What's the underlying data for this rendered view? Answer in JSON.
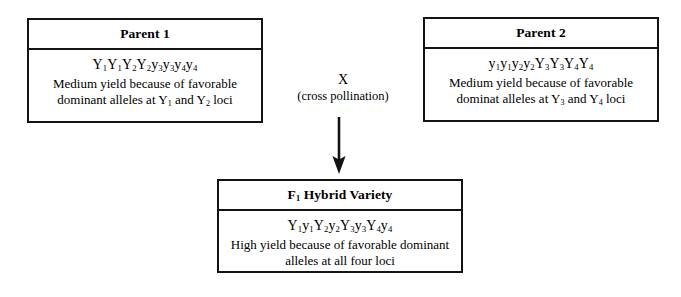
{
  "diagram": {
    "parent1": {
      "header": "Parent 1",
      "genotype_parts": [
        {
          "base": "Y",
          "sub": "1"
        },
        {
          "base": "Y",
          "sub": "1"
        },
        {
          "base": "Y",
          "sub": "2"
        },
        {
          "base": "Y",
          "sub": "2"
        },
        {
          "base": "y",
          "sub": "3"
        },
        {
          "base": "y",
          "sub": "3"
        },
        {
          "base": "y",
          "sub": "4"
        },
        {
          "base": "y",
          "sub": "4"
        }
      ],
      "genotype_text": "Y1Y1Y2Y2y3y3y4y4",
      "description_line1": "Medium yield because of favorable",
      "description_prefix": "dominant alleles at Y",
      "locus1": "1",
      "description_middle": " and Y",
      "locus2": "2",
      "description_suffix": " loci"
    },
    "parent2": {
      "header": "Parent 2",
      "genotype_parts": [
        {
          "base": "y",
          "sub": "1"
        },
        {
          "base": "y",
          "sub": "1"
        },
        {
          "base": "y",
          "sub": "2"
        },
        {
          "base": "y",
          "sub": "2"
        },
        {
          "base": "Y",
          "sub": "3"
        },
        {
          "base": "Y",
          "sub": "3"
        },
        {
          "base": "Y",
          "sub": "4"
        },
        {
          "base": "Y",
          "sub": "4"
        }
      ],
      "genotype_text": "y1y1y2y2Y3Y3Y4Y4",
      "description_line1": "Medium yield because of favorable",
      "description_prefix": "dominat alleles at Y",
      "locus1": "3",
      "description_middle": " and Y",
      "locus2": "4",
      "description_suffix": " loci"
    },
    "f1": {
      "header_prefix": "F",
      "header_sub": "1",
      "header_suffix": " Hybrid Variety",
      "header_text": "F1 Hybrid Variety",
      "genotype_parts": [
        {
          "base": "Y",
          "sub": "1"
        },
        {
          "base": "y",
          "sub": "1"
        },
        {
          "base": "Y",
          "sub": "2"
        },
        {
          "base": "y",
          "sub": "2"
        },
        {
          "base": "Y",
          "sub": "3"
        },
        {
          "base": "y",
          "sub": "3"
        },
        {
          "base": "Y",
          "sub": "4"
        },
        {
          "base": "y",
          "sub": "4"
        }
      ],
      "genotype_text": "Y1y1Y2y2Y3y3Y4y4",
      "description_line1": "High yield because of favorable dominant",
      "description_line2": "alleles at all four loci"
    },
    "cross": {
      "symbol": "X",
      "caption": "(cross pollination)"
    },
    "colors": {
      "line": "#141414",
      "text": "#000000",
      "background": "#ffffff"
    }
  }
}
